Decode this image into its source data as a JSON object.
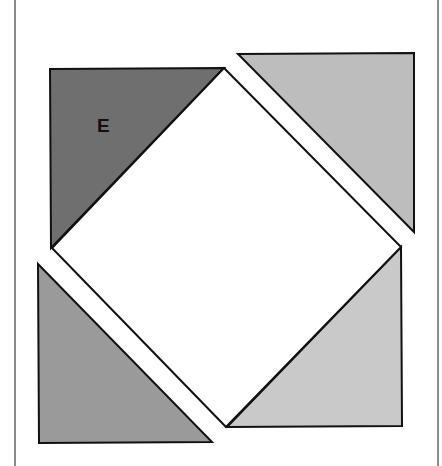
{
  "diagram": {
    "labels": {
      "piece_e": "E"
    },
    "colors": {
      "outline": "#111111",
      "frame": "#8a8a8a",
      "square": "#ffffff",
      "triangle_top_left": "#6f6f6f",
      "triangle_top_right": "#bdbdbd",
      "triangle_bottom_left": "#9a9a9a",
      "triangle_bottom_right": "#c9c9c9"
    },
    "shapes": {
      "square": "224,68 401,247 226,427 52,248",
      "triangle_top_left": "50,69 224,68 51,248",
      "triangle_top_right": "238,54 414,53 414,232",
      "triangle_bottom_left": "38,264 212,442 39,443",
      "triangle_bottom_right": "227,427 401,247 402,426"
    }
  }
}
